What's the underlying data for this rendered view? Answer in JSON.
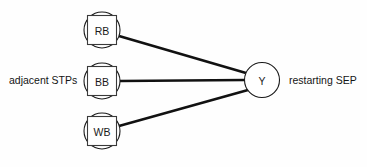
{
  "diagram": {
    "type": "node-link-graph",
    "background_color": "#fefefe",
    "stroke_color": "#111111",
    "labels": {
      "left": "adjacent STPs",
      "right": "restarting SEP"
    },
    "source_nodes": [
      {
        "id": "rb",
        "label": "RB",
        "shape": "circle-with-inscribed-square",
        "cx": 102,
        "cy": 30,
        "r": 18
      },
      {
        "id": "bb",
        "label": "BB",
        "shape": "circle-with-inscribed-square",
        "cx": 102,
        "cy": 81,
        "r": 18
      },
      {
        "id": "wb",
        "label": "WB",
        "shape": "circle-with-inscribed-square",
        "cx": 102,
        "cy": 131,
        "r": 18
      }
    ],
    "target_node": {
      "id": "y",
      "label": "Y",
      "shape": "circle",
      "cx": 262,
      "cy": 80,
      "r": 17.5
    },
    "edges": [
      {
        "id": "edge-rb-y",
        "from": "rb",
        "to": "y",
        "x1": 119,
        "y1": 36,
        "x2": 246,
        "y2": 73
      },
      {
        "id": "edge-bb-y",
        "from": "bb",
        "to": "y",
        "x1": 120,
        "y1": 81,
        "x2": 245,
        "y2": 80
      },
      {
        "id": "edge-wb-y",
        "from": "wb",
        "to": "y",
        "x1": 119,
        "y1": 126,
        "x2": 248,
        "y2": 90
      }
    ]
  }
}
